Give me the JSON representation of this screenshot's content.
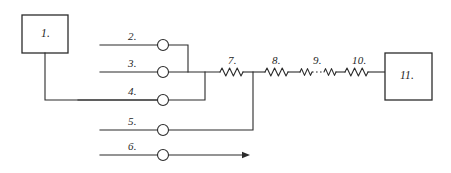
{
  "diagram": {
    "style": {
      "line_color": "#2b2b2b",
      "background": "#ffffff",
      "label_style": "italic-serif"
    },
    "boxes": [
      {
        "id": "box-1",
        "label": "1.",
        "x": 22,
        "y": 15,
        "w": 46,
        "h": 38
      },
      {
        "id": "box-11",
        "label": "11.",
        "x": 385,
        "y": 53,
        "w": 47,
        "h": 47
      }
    ],
    "lines": [
      {
        "id": "line-2",
        "label": "2.",
        "label_x": 128,
        "label_y": 31,
        "y": 45
      },
      {
        "id": "line-3",
        "label": "3.",
        "label_x": 128,
        "label_y": 58,
        "y": 72
      },
      {
        "id": "line-4",
        "label": "4.",
        "label_x": 128,
        "label_y": 86,
        "y": 100
      },
      {
        "id": "line-5",
        "label": "5.",
        "label_x": 128,
        "label_y": 116,
        "y": 130
      },
      {
        "id": "line-6",
        "label": "6.",
        "label_x": 128,
        "label_y": 141,
        "y": 155
      }
    ],
    "nodes": [
      {
        "id": "node-2",
        "cx": 163,
        "cy": 45,
        "r": 5.5
      },
      {
        "id": "node-3",
        "cx": 163,
        "cy": 72,
        "r": 5.5
      },
      {
        "id": "node-4",
        "cx": 163,
        "cy": 100,
        "r": 5.5
      },
      {
        "id": "node-5",
        "cx": 163,
        "cy": 130,
        "r": 5.5
      },
      {
        "id": "node-6",
        "cx": 163,
        "cy": 155,
        "r": 5.5
      }
    ],
    "coils": [
      {
        "id": "coil-7",
        "label": "7.",
        "label_x": 228,
        "label_y": 55,
        "x1": 220,
        "x2": 243,
        "y": 72,
        "turns": 6,
        "amp": 4.0
      },
      {
        "id": "coil-8",
        "label": "8.",
        "label_x": 272,
        "label_y": 55,
        "x1": 265,
        "x2": 288,
        "y": 72,
        "turns": 6,
        "amp": 4.0
      },
      {
        "id": "coil-9a",
        "label": "",
        "label_x": 0,
        "label_y": 0,
        "x1": 300,
        "x2": 312,
        "y": 72,
        "turns": 3,
        "amp": 3.4
      },
      {
        "id": "coil-9b",
        "label": "",
        "label_x": 0,
        "label_y": 0,
        "x1": 324,
        "x2": 336,
        "y": 72,
        "turns": 3,
        "amp": 3.4
      },
      {
        "id": "coil-10",
        "label": "10.",
        "label_x": 352,
        "label_y": 55,
        "x1": 345,
        "x2": 368,
        "y": 72,
        "turns": 6,
        "amp": 4.0
      }
    ],
    "coil_9_label": {
      "text": "9.",
      "x": 313,
      "y": 55
    },
    "continuation": {
      "id": "ellipsis-link",
      "x1": 313,
      "x2": 323,
      "y": 72
    },
    "arrow": {
      "id": "flow-arrow-line-6",
      "tip_x": 250,
      "y": 155
    }
  }
}
